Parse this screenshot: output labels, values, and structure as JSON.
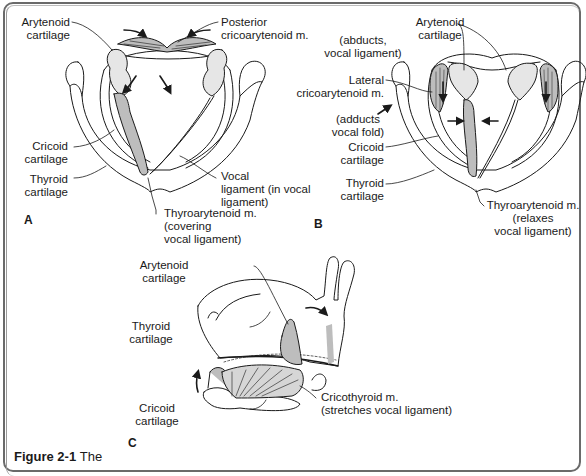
{
  "figure": {
    "caption_prefix": "Figure 2-1",
    "caption_rest": "The",
    "panels": {
      "A": {
        "letter": "A",
        "labels": {
          "arytenoid_1": "Arytenoid",
          "arytenoid_2": "cartilage",
          "posterior_1": "Posterior",
          "posterior_2": "cricoarytenoid m.",
          "posterior_3": "(abducts,",
          "posterior_4": "vocal ligament)",
          "cricoid_1": "Cricoid",
          "cricoid_2": "cartilage",
          "thyroid_1": "Thyroid",
          "thyroid_2": "cartilage",
          "vocal_1": "Vocal",
          "vocal_2": "ligament (in vocal",
          "vocal_3": "ligament)",
          "thyroaryt_1": "Thyroarytenoid m.",
          "thyroaryt_2": "(covering",
          "thyroaryt_3": "vocal ligament)"
        }
      },
      "B": {
        "letter": "B",
        "labels": {
          "arytenoid_1": "Arytenoid",
          "arytenoid_2": "cartilage",
          "lateral_1": "Lateral",
          "lateral_2": "cricoarytenoid m.",
          "lateral_3": "(adducts",
          "lateral_4": "vocal fold)",
          "cricoid_1": "Cricoid",
          "cricoid_2": "cartilage",
          "thyroid_1": "Thyroid",
          "thyroid_2": "cartilage",
          "thyroaryt_1": "Thyroarytenoid m.",
          "thyroaryt_2": "(relaxes",
          "thyroaryt_3": "vocal ligament)"
        }
      },
      "C": {
        "letter": "C",
        "labels": {
          "arytenoid_1": "Arytenoid",
          "arytenoid_2": "cartilage",
          "thyroid_1": "Thyroid",
          "thyroid_2": "cartilage",
          "cricoid_1": "Cricoid",
          "cricoid_2": "cartilage",
          "cricothyroid_1": "Cricothyroid m.",
          "cricothyroid_2": "(stretches vocal ligament)"
        }
      }
    },
    "colors": {
      "line": "#1a1a1a",
      "muscle_fill": "#bdbdbd",
      "cartilage_fill": "#e6e6e6",
      "frame": "#6a6a6a"
    }
  }
}
